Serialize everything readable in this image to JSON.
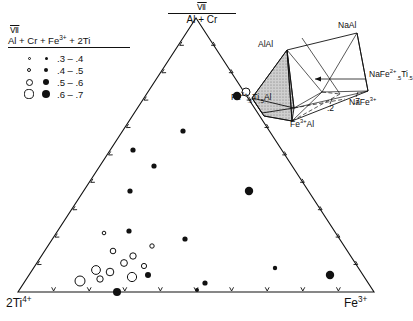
{
  "figure": {
    "type": "ternary-scatter-diagram",
    "background": "#ffffff",
    "line_color": "#111111"
  },
  "legend": {
    "title_numeral": "Ⅶ",
    "title_denominator": "Al + Cr + Fe",
    "title_denominator_sup": "3+",
    "title_denominator_tail": " + 2Ti",
    "rows": [
      {
        "range": ".3 – .4",
        "open_px": 3.0,
        "filled_px": 3.0
      },
      {
        "range": ".4 – .5",
        "open_px": 4.6,
        "filled_px": 4.4
      },
      {
        "range": ".5 – .6",
        "open_px": 7.0,
        "filled_px": 6.2
      },
      {
        "range": ".6 – .7",
        "open_px": 9.2,
        "filled_px": 8.4
      }
    ]
  },
  "triangle": {
    "apex_top": {
      "numeral": "Ⅶ",
      "label": "Al + Cr"
    },
    "corner_bottom_left": {
      "base": "2Ti",
      "sup": "4+"
    },
    "corner_bottom_right": {
      "base": "Fe",
      "sup": "3+"
    },
    "ticks_per_edge": 9,
    "vertices_px": {
      "top": [
        196,
        18
      ],
      "left": [
        18,
        292
      ],
      "right": [
        374,
        292
      ]
    }
  },
  "chart_data": {
    "type": "scatter",
    "title": "",
    "axes": [
      "Al + Cr (VI)",
      "2Ti(4+)",
      "Fe(3+)"
    ],
    "ternary": true,
    "legend_variable": "VI / (Al + Cr + Fe3+ + 2Ti)",
    "legend_bins": [
      ".3-.4",
      ".4-.5",
      ".5-.6",
      ".6-.7"
    ],
    "series": [
      {
        "name": "filled-circles",
        "marker": "filled",
        "points": [
          {
            "x": 133,
            "y": 150,
            "r": 2.6
          },
          {
            "x": 154,
            "y": 166,
            "r": 2.6
          },
          {
            "x": 183,
            "y": 131,
            "r": 2.6
          },
          {
            "x": 130,
            "y": 191,
            "r": 2.6
          },
          {
            "x": 237,
            "y": 96,
            "r": 4.2
          },
          {
            "x": 249,
            "y": 191,
            "r": 4.2
          },
          {
            "x": 185,
            "y": 239,
            "r": 2.6
          },
          {
            "x": 129,
            "y": 231,
            "r": 2.6
          },
          {
            "x": 205,
            "y": 283,
            "r": 2.6
          },
          {
            "x": 148,
            "y": 275,
            "r": 3.0
          },
          {
            "x": 117,
            "y": 292,
            "r": 4.0
          },
          {
            "x": 275,
            "y": 268,
            "r": 2.2
          },
          {
            "x": 330,
            "y": 275,
            "r": 4.2
          },
          {
            "x": 197,
            "y": 290,
            "r": 2.0
          }
        ]
      },
      {
        "name": "open-circles",
        "marker": "open",
        "points": [
          {
            "x": 246,
            "y": 92,
            "r": 4.0
          },
          {
            "x": 104,
            "y": 233,
            "r": 1.8
          },
          {
            "x": 152,
            "y": 246,
            "r": 2.2
          },
          {
            "x": 113,
            "y": 251,
            "r": 2.8
          },
          {
            "x": 133,
            "y": 256,
            "r": 3.2
          },
          {
            "x": 124,
            "y": 263,
            "r": 3.4
          },
          {
            "x": 144,
            "y": 266,
            "r": 2.6
          },
          {
            "x": 96,
            "y": 270,
            "r": 4.4
          },
          {
            "x": 110,
            "y": 272,
            "r": 3.8
          },
          {
            "x": 132,
            "y": 277,
            "r": 4.6
          },
          {
            "x": 80,
            "y": 281,
            "r": 5.0
          },
          {
            "x": 100,
            "y": 279,
            "r": 3.2
          }
        ]
      }
    ]
  },
  "inset": {
    "labels": [
      {
        "id": "alal",
        "text": "AlAl"
      },
      {
        "id": "naal",
        "text": "NaAl"
      },
      {
        "id": "fe5ti5al",
        "html": "Fe<sup>2+</sup><sub>.5</sub>Ti<sub>.5</sub>Al"
      },
      {
        "id": "fe3al",
        "html": "Fe<sup>3+</sup>Al"
      },
      {
        "id": "nafe5ti5",
        "html": "NaFe<sup>2+</sup><sub>.5</sub>Ti<sub>.5</sub>"
      },
      {
        "id": "nafe3",
        "html": "NaFe<sup>3+</sup>"
      }
    ],
    "tick_labels": [
      ".2",
      ".7"
    ],
    "shaded_face_color": "#b8b8b8"
  }
}
